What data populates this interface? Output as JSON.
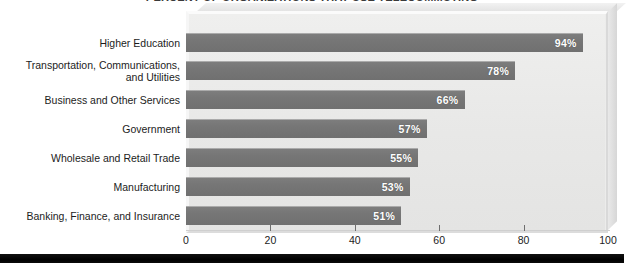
{
  "chart_data": {
    "type": "bar",
    "orientation": "horizontal",
    "title": "PERCENT OF ORGANIZATIONS THAT USE TELECOMMUTING",
    "title_visible": "cropped",
    "xlabel": "",
    "ylabel": "",
    "xlim": [
      0,
      100
    ],
    "xticks": [
      0,
      20,
      40,
      60,
      80,
      100
    ],
    "grid": false,
    "legend": "none",
    "value_suffix": "%",
    "bar_color": "#767676",
    "panel_color": "#eaeaea",
    "value_label_color": "#ffffff",
    "categories": [
      "Higher Education",
      "Transportation, Communications,\nand Utilities",
      "Business and Other Services",
      "Government",
      "Wholesale and Retail Trade",
      "Manufacturing",
      "Banking, Finance, and Insurance"
    ],
    "values": [
      94,
      78,
      66,
      57,
      55,
      53,
      51
    ],
    "value_labels": [
      "94%",
      "78%",
      "66%",
      "57%",
      "55%",
      "53%",
      "51%"
    ],
    "tick_labels": [
      "0",
      "20",
      "40",
      "60",
      "80",
      "100"
    ]
  }
}
